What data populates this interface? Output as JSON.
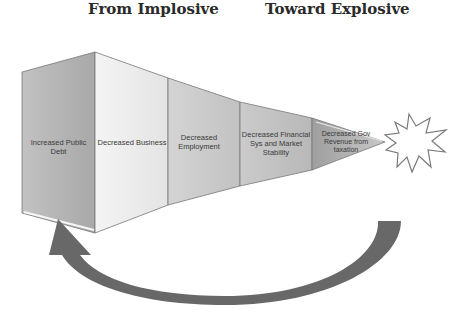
{
  "headings": {
    "left": "From Implosive",
    "right": "Toward Explosive"
  },
  "funnel": {
    "segments": [
      {
        "label": "Increased Public Debt",
        "fill": "#b4b4b4"
      },
      {
        "label": "Decreased Business",
        "fill": "#ededed"
      },
      {
        "label": "Decreased Employment",
        "fill": "#cdcdcd"
      },
      {
        "label": "Decreased Financial Sys and Market Stability",
        "fill": "#c4c4c4"
      },
      {
        "label": "Decreased Gov Revenue from taxation",
        "fill": "#a9a9a9"
      }
    ]
  },
  "explosion": {
    "icon": "starburst-icon"
  },
  "cycle_arrow": {
    "color": "#666666",
    "direction": "from explosion back to start"
  }
}
